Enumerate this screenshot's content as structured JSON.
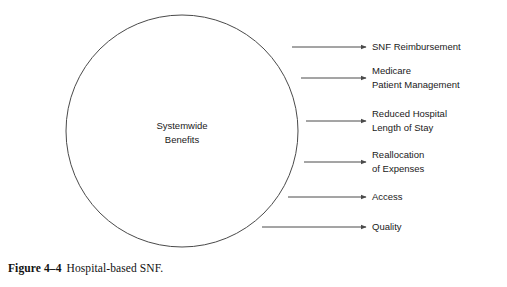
{
  "figure": {
    "caption_number": "Figure 4–4",
    "caption_title": "Hospital-based SNF.",
    "colors": {
      "stroke": "#4a4a4a",
      "text": "#1a1a1a",
      "background": "#ffffff"
    }
  },
  "central_node": {
    "shape": "circle",
    "line_1": "Systemwide",
    "line_2": "Benefits",
    "center_x": 182,
    "center_y": 131,
    "radius": 116
  },
  "branches": [
    {
      "id": "snf-reimbursement",
      "lines": [
        "SNF Reimbursement"
      ],
      "arrow_y": 47,
      "arrow_start_x": 292,
      "arrow_end_x": 366,
      "label_x": 372
    },
    {
      "id": "medicare-patient-management",
      "lines": [
        "Medicare",
        "Patient Management"
      ],
      "arrow_y": 78,
      "arrow_start_x": 301,
      "arrow_end_x": 366,
      "label_x": 372
    },
    {
      "id": "reduced-hospital-length-of-stay",
      "lines": [
        "Reduced Hospital",
        "Length of Stay"
      ],
      "arrow_y": 121,
      "arrow_start_x": 306,
      "arrow_end_x": 366,
      "label_x": 372
    },
    {
      "id": "reallocation-of-expenses",
      "lines": [
        "Reallocation",
        "of Expenses"
      ],
      "arrow_y": 162,
      "arrow_start_x": 304,
      "arrow_end_x": 366,
      "label_x": 372
    },
    {
      "id": "access",
      "lines": [
        "Access"
      ],
      "arrow_y": 197,
      "arrow_start_x": 288,
      "arrow_end_x": 366,
      "label_x": 372
    },
    {
      "id": "quality",
      "lines": [
        "Quality"
      ],
      "arrow_y": 227,
      "arrow_start_x": 262,
      "arrow_end_x": 366,
      "label_x": 372
    }
  ]
}
